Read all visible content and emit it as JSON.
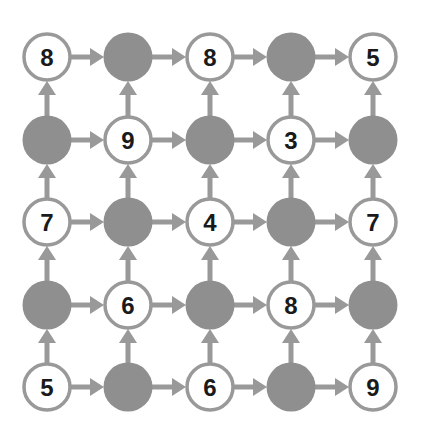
{
  "diagram": {
    "type": "grid-graph",
    "rows": 5,
    "cols": 5,
    "colors": {
      "edge": "#999999",
      "node_stroke": "#999999",
      "node_fill_empty": "#ffffff",
      "node_fill_shaded": "#8f8f8f",
      "label": "#1a1a1a"
    },
    "arrow_directions": [
      "right",
      "up"
    ],
    "cells": [
      [
        "8",
        "",
        "8",
        "",
        "5"
      ],
      [
        "",
        "9",
        "",
        "3",
        ""
      ],
      [
        "7",
        "",
        "4",
        "",
        "7"
      ],
      [
        "",
        "6",
        "",
        "8",
        ""
      ],
      [
        "5",
        "",
        "6",
        "",
        "9"
      ]
    ],
    "shaded": [
      [
        false,
        true,
        false,
        true,
        false
      ],
      [
        true,
        false,
        true,
        false,
        true
      ],
      [
        false,
        true,
        false,
        true,
        false
      ],
      [
        true,
        false,
        true,
        false,
        true
      ],
      [
        false,
        true,
        false,
        true,
        false
      ]
    ]
  }
}
